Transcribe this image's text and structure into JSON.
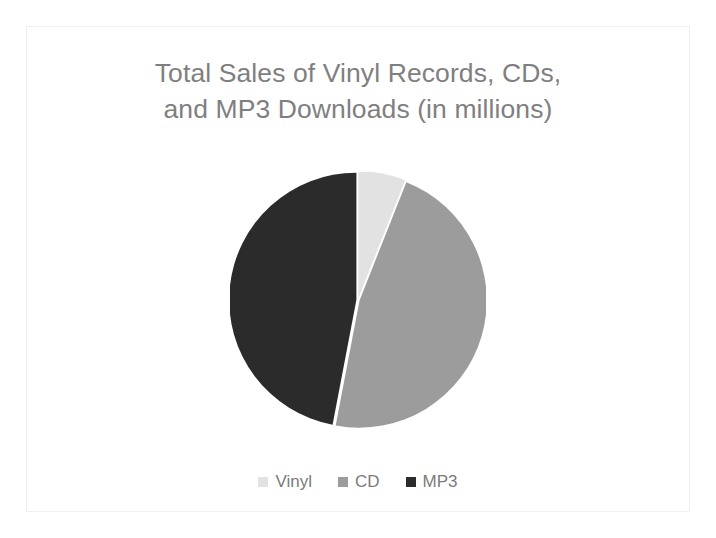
{
  "slide": {
    "background_color": "#FFFFFF",
    "frame_color": "#EFEFEF"
  },
  "chart_title": {
    "text": "Total Sales of Vinyl Records, CDs,\nand MP3 Downloads (in millions)",
    "line1": "Total Sales of Vinyl Records, CDs,",
    "line2": "and MP3 Downloads (in millions)",
    "color": "#7F7F7F"
  },
  "legend": {
    "position": "bottom",
    "items": [
      {
        "label": "Vinyl",
        "color": "#E2E2E2",
        "marker": "square-swatch"
      },
      {
        "label": "CD",
        "color": "#9C9C9C",
        "marker": "square-swatch"
      },
      {
        "label": "MP3",
        "color": "#2B2B2B",
        "marker": "square-swatch"
      }
    ]
  },
  "chart_data": {
    "type": "pie",
    "title": "Total Sales of Vinyl Records, CDs, and MP3 Downloads (in millions)",
    "xlabel": "",
    "ylabel": "",
    "categories": [
      "Vinyl",
      "CD",
      "MP3"
    ],
    "values": [
      6,
      47,
      47
    ],
    "unit": "millions",
    "percentages": [
      6,
      47,
      47
    ],
    "colors": [
      "#E2E2E2",
      "#9C9C9C",
      "#2B2B2B"
    ],
    "slice_start_angles_deg": [
      0,
      21.6,
      190.8
    ],
    "slice_sweep_angles_deg": [
      21.6,
      169.2,
      169.2
    ],
    "start_angle_deg": 0,
    "direction": "clockwise",
    "slice_gap": true,
    "gap_color": "#FFFFFF",
    "labels_shown": false,
    "legend_position": "bottom",
    "grid": false
  }
}
